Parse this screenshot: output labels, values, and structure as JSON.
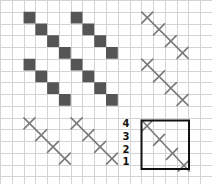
{
  "diagram": {
    "grid": {
      "cols": 18,
      "rows": 16,
      "cell_w": 11.78,
      "cell_h": 11.75,
      "line_color": "#d4d4d4"
    },
    "filled_color": "#555555",
    "stitch_color": "#7a7a7a",
    "filled_cells": [
      [
        2,
        1
      ],
      [
        3,
        2
      ],
      [
        4,
        3
      ],
      [
        5,
        4
      ],
      [
        6,
        1
      ],
      [
        7,
        2
      ],
      [
        8,
        3
      ],
      [
        9,
        4
      ],
      [
        2,
        5
      ],
      [
        3,
        6
      ],
      [
        4,
        7
      ],
      [
        5,
        8
      ],
      [
        6,
        5
      ],
      [
        7,
        6
      ],
      [
        8,
        7
      ],
      [
        9,
        8
      ]
    ],
    "stitch_rows": [
      {
        "name": "top-right-upper",
        "cells": [
          [
            12,
            1
          ],
          [
            13,
            2
          ],
          [
            14,
            3
          ],
          [
            15,
            4
          ]
        ]
      },
      {
        "name": "top-right-lower",
        "cells": [
          [
            12,
            5
          ],
          [
            13,
            6
          ],
          [
            14,
            7
          ],
          [
            15,
            8
          ]
        ]
      },
      {
        "name": "bottom-left-a",
        "cells": [
          [
            2,
            10
          ],
          [
            3,
            11
          ],
          [
            4,
            12
          ],
          [
            5,
            13
          ]
        ]
      },
      {
        "name": "bottom-left-b",
        "cells": [
          [
            6,
            10
          ],
          [
            7,
            11
          ],
          [
            8,
            12
          ],
          [
            9,
            13
          ]
        ]
      },
      {
        "name": "boxed-example",
        "cells": [
          [
            12,
            10.2
          ],
          [
            13,
            11.4
          ],
          [
            14.1,
            12.6
          ],
          [
            15.1,
            13.6
          ]
        ]
      }
    ],
    "highlight_box": {
      "x": 141.5,
      "y": 120.5,
      "w": 47.5,
      "h": 48.5,
      "color": "#111111",
      "stroke_width": 2
    },
    "step_labels": [
      {
        "text": "4",
        "x": 120,
        "y": 118
      },
      {
        "text": "3",
        "x": 120,
        "y": 131
      },
      {
        "text": "2",
        "x": 120,
        "y": 144
      },
      {
        "text": "1",
        "x": 120,
        "y": 156
      }
    ]
  }
}
